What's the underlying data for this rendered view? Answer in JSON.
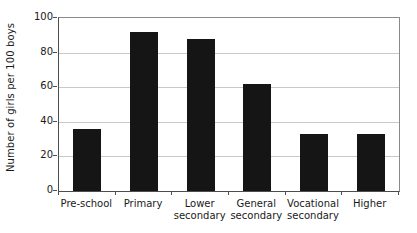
{
  "chart_data": {
    "type": "bar",
    "title": "",
    "subtitle": "",
    "xlabel": "",
    "ylabel": "Number of girls per 100 boys",
    "categories": [
      "Pre-school",
      "Primary",
      "Lower secondary",
      "General secondary",
      "Vocational secondary",
      "Higher"
    ],
    "category_lines": [
      [
        "Pre-school",
        ""
      ],
      [
        "Primary",
        ""
      ],
      [
        "Lower",
        "secondary"
      ],
      [
        "General",
        "secondary"
      ],
      [
        "Vocational",
        "secondary"
      ],
      [
        "Higher",
        ""
      ]
    ],
    "values": [
      36,
      92,
      88,
      62,
      33,
      33
    ],
    "ylim": [
      0,
      100
    ],
    "yticks": [
      0,
      20,
      40,
      60,
      80,
      100
    ],
    "ytick_labels": [
      "0",
      "20",
      "40",
      "60",
      "80",
      "100"
    ],
    "grid": true,
    "grid_axis": "y",
    "legend": false,
    "legend_position": "none",
    "bar_color": "#151515",
    "grid_color": "#c8c8c8",
    "axis_color": "#4d4d4d",
    "background_color": "#ffffff"
  }
}
